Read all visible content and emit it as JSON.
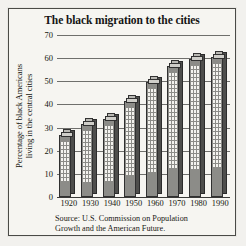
{
  "chart_data": {
    "type": "bar",
    "title": "The black migration to the cities",
    "xlabel": "",
    "ylabel": "Percentage of black Americans living in the central cities",
    "ylabel_line1": "Percentage of black Americans",
    "ylabel_line2": "living in the central cities",
    "categories": [
      "1920",
      "1930",
      "1940",
      "1950",
      "1960",
      "1970",
      "1980",
      "1990"
    ],
    "values": [
      28,
      33,
      35,
      43,
      51,
      58,
      61,
      62
    ],
    "ylim": [
      0,
      70
    ],
    "yticks": [
      0,
      10,
      20,
      30,
      40,
      50,
      60,
      70
    ],
    "grid": true,
    "legend": "none",
    "source": "Source: U.S. Commission on Population Growth and the American Future.",
    "source_line1": "Source: U.S. Commission on Population",
    "source_line2": "Growth and the American Future.",
    "colors": {
      "background": "#f6f5f1",
      "frame": "#4a4a47",
      "bar_face": "#8c8c88",
      "bar_side": "#4e4e4c",
      "bar_roof": "#cfcec9",
      "window": "#f4f3ef",
      "text": "#15150f",
      "gridline": "#6f6f6c"
    }
  }
}
